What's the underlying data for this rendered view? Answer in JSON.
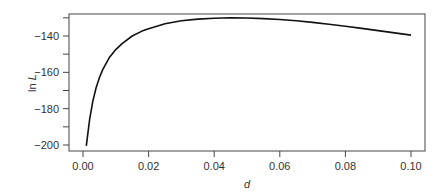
{
  "chart_data": {
    "type": "line",
    "title": "",
    "xlabel": "d",
    "ylabel": "ln L",
    "xlim": [
      0.0,
      0.1
    ],
    "ylim": [
      -202,
      -128
    ],
    "x_ticks": [
      "0.00",
      "0.02",
      "0.04",
      "0.06",
      "0.08",
      "0.10"
    ],
    "y_ticks": [
      "-140",
      "-160",
      "-180",
      "-200"
    ],
    "grid": false,
    "legend": null,
    "series": [
      {
        "name": "ln L",
        "x": [
          0.001,
          0.002,
          0.003,
          0.004,
          0.005,
          0.006,
          0.008,
          0.01,
          0.012,
          0.015,
          0.018,
          0.02,
          0.025,
          0.03,
          0.035,
          0.04,
          0.045,
          0.05,
          0.055,
          0.06,
          0.065,
          0.07,
          0.075,
          0.08,
          0.085,
          0.09,
          0.095,
          0.1
        ],
        "y": [
          -200.5,
          -186,
          -176,
          -168.5,
          -163,
          -158.5,
          -152,
          -147.5,
          -144,
          -140,
          -137.3,
          -136,
          -133.3,
          -131.6,
          -130.7,
          -130.2,
          -130.0,
          -130.1,
          -130.4,
          -130.9,
          -131.6,
          -132.5,
          -133.5,
          -134.6,
          -135.8,
          -137.0,
          -138.3,
          -139.5
        ]
      }
    ]
  },
  "axes": {
    "xlabel": "d",
    "ylabel_main": "ln ",
    "ylabel_italic": "L"
  }
}
